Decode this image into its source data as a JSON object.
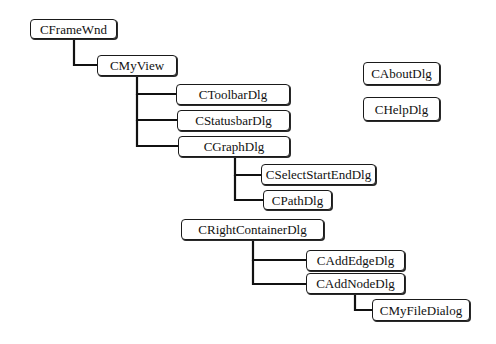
{
  "diagram": {
    "type": "class-hierarchy-tree",
    "nodes": [
      {
        "id": "cframewnd",
        "label": "CFrameWnd",
        "x": 30,
        "y": 19,
        "w": 87,
        "h": 20
      },
      {
        "id": "cmyview",
        "label": "CMyView",
        "x": 97,
        "y": 55,
        "w": 80,
        "h": 21
      },
      {
        "id": "ctoolbardlg",
        "label": "CToolbarDlg",
        "x": 176,
        "y": 84,
        "w": 114,
        "h": 21
      },
      {
        "id": "cstatusbardlg",
        "label": "CStatusbarDlg",
        "x": 177,
        "y": 110,
        "w": 113,
        "h": 21
      },
      {
        "id": "cgraphdlg",
        "label": "CGraphDlg",
        "x": 178,
        "y": 136,
        "w": 112,
        "h": 21
      },
      {
        "id": "cselectstartenddlg",
        "label": "CSelectStartEndDlg",
        "x": 261,
        "y": 164,
        "w": 115,
        "h": 21
      },
      {
        "id": "cpathdlg",
        "label": "CPathDlg",
        "x": 263,
        "y": 190,
        "w": 69,
        "h": 20
      },
      {
        "id": "crightcontainerdlg",
        "label": "CRightContainerDlg",
        "x": 181,
        "y": 219,
        "w": 143,
        "h": 21
      },
      {
        "id": "caddedgedlg",
        "label": "CAddEdgeDlg",
        "x": 306,
        "y": 250,
        "w": 99,
        "h": 21
      },
      {
        "id": "caddnodedlg",
        "label": "CAddNodeDlg",
        "x": 306,
        "y": 273,
        "w": 99,
        "h": 21
      },
      {
        "id": "cmyfiledialog",
        "label": "CMyFileDialog",
        "x": 372,
        "y": 299,
        "w": 98,
        "h": 22
      },
      {
        "id": "caboutdlg",
        "label": "CAboutDlg",
        "x": 363,
        "y": 62,
        "w": 77,
        "h": 23
      },
      {
        "id": "chelpdlg",
        "label": "CHelpDlg",
        "x": 363,
        "y": 97,
        "w": 77,
        "h": 24
      }
    ],
    "edges": [
      {
        "from": "CFrameWnd",
        "to": "CMyView",
        "path": "M74 39 V65 H97"
      },
      {
        "from": "CMyView",
        "to": "CToolbarDlg",
        "path": "M137 76 V94 H176"
      },
      {
        "from": "CMyView",
        "to": "CStatusbarDlg",
        "path": "M137 94 V120 H177"
      },
      {
        "from": "CMyView",
        "to": "CGraphDlg",
        "path": "M137 120 V146 H178"
      },
      {
        "from": "CGraphDlg",
        "to": "CSelectStartEndDlg",
        "path": "M235 157 V175 H261"
      },
      {
        "from": "CGraphDlg",
        "to": "CPathDlg",
        "path": "M235 175 V200 H263"
      },
      {
        "from": "CRightContainerDlg",
        "to": "CAddEdgeDlg",
        "path": "M253 240 V260 H306"
      },
      {
        "from": "CRightContainerDlg",
        "to": "CAddNodeDlg",
        "path": "M253 260 V284 H306"
      },
      {
        "from": "CAddNodeDlg",
        "to": "CMyFileDialog",
        "path": "M355 294 V310 H372"
      }
    ],
    "colors": {
      "line": "#111111",
      "box_border": "#1a1a1a",
      "text": "#111111",
      "background": "#ffffff"
    }
  }
}
